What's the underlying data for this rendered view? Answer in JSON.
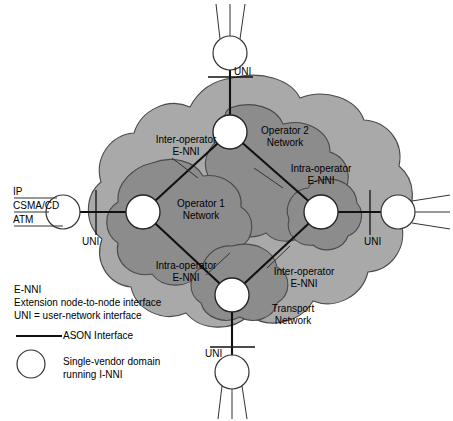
{
  "figure": {
    "type": "network-architecture-diagram",
    "colors": {
      "outer_cloud_fill": "#a9a9a9",
      "inner_cloud_fill": "#8c8c8c",
      "node_fill": "#ffffff",
      "stroke": "#1a1a1a",
      "thin_stroke": "#555555",
      "background": "#ffffff",
      "text": "#000000"
    }
  },
  "access_stack": {
    "rows": [
      "IP",
      "CSMA/CD",
      "ATM"
    ]
  },
  "interface_labels": {
    "uni_top": "UNI",
    "uni_left": "UNI",
    "uni_right": "UNI",
    "uni_bottom": "UNI"
  },
  "clouds": {
    "operator1": {
      "label_line1": "Operator 1",
      "label_line2": "Network"
    },
    "operator2": {
      "label_line1": "Operator 2",
      "label_line2": "Network"
    },
    "transport": {
      "label_line1": "Transport",
      "label_line2": "Network"
    }
  },
  "annotations": {
    "inter_operator_top": {
      "line1": "Inter-operator",
      "line2": "E-NNI"
    },
    "intra_operator_right": {
      "line1": "Intra-operator",
      "line2": "E-NNI"
    },
    "intra_operator_bottom": {
      "line1": "Intra-operator",
      "line2": "E-NNI"
    },
    "inter_operator_bottom": {
      "line1": "Inter-operator",
      "line2": "E-NNI"
    }
  },
  "legend": {
    "abbrev_line1": "E-NNI",
    "abbrev_line2": "Extension node-to-node interface",
    "abbrev_line3": "UNI = user-network interface",
    "line_symbol_label": "ASON Interface",
    "circle_symbol_label_line1": "Single-vendor domain",
    "circle_symbol_label_line2": "running I-NNI"
  }
}
